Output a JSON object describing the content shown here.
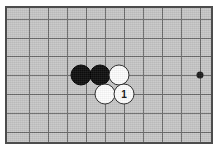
{
  "diagram": {
    "game": "Go",
    "board_color": "#c6c6c6",
    "line_color": "#6a6a6a",
    "border_color": "#4c4c4c",
    "black_stone_color": "#0d0d0d",
    "white_stone_color": "#fdfdfd",
    "star_point_color": "#1a1a1a"
  },
  "board": {
    "cell_size": 19,
    "origin_x": 22,
    "origin_y": 11,
    "columns": 10,
    "rows": 7,
    "vertical_lines_x": [
      22,
      41,
      60,
      79,
      98,
      117,
      136,
      155,
      174,
      193
    ],
    "horizontal_lines_y": [
      11,
      30,
      48,
      67,
      86,
      105,
      124
    ],
    "star_points": [
      {
        "name": "hoshi-right",
        "x": 193,
        "y": 67
      }
    ]
  },
  "stones": [
    {
      "id": "black-1",
      "color": "black",
      "label": "",
      "x": 74,
      "y": 67
    },
    {
      "id": "black-2",
      "color": "black",
      "label": "",
      "x": 93,
      "y": 67
    },
    {
      "id": "white-1",
      "color": "white",
      "label": "",
      "x": 112,
      "y": 67
    },
    {
      "id": "white-2",
      "color": "white",
      "label": "",
      "x": 98,
      "y": 86
    },
    {
      "id": "white-3-move-1",
      "color": "white",
      "label": "1",
      "x": 117,
      "y": 86
    }
  ]
}
